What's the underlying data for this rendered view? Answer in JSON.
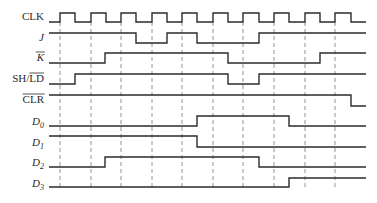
{
  "x_start": 49,
  "x_end": 366,
  "clock_edges": [
    60,
    91,
    121,
    152,
    182,
    213,
    243,
    274,
    305,
    335
  ],
  "dash_top": 22,
  "dash_bottom": 187,
  "signals": [
    {
      "name": "clk",
      "label": "CLK",
      "italic": false,
      "overline": false,
      "label_y": 16,
      "hi": 13,
      "lo": 22,
      "points": [
        [
          49,
          0
        ],
        [
          60,
          1
        ],
        [
          75,
          0
        ],
        [
          91,
          1
        ],
        [
          106,
          0
        ],
        [
          121,
          1
        ],
        [
          136,
          0
        ],
        [
          152,
          1
        ],
        [
          167,
          0
        ],
        [
          182,
          1
        ],
        [
          197,
          0
        ],
        [
          213,
          1
        ],
        [
          228,
          0
        ],
        [
          243,
          1
        ],
        [
          259,
          0
        ],
        [
          274,
          1
        ],
        [
          289,
          0
        ],
        [
          305,
          1
        ],
        [
          320,
          0
        ],
        [
          335,
          1
        ],
        [
          351,
          0
        ]
      ]
    },
    {
      "name": "j",
      "label": "J",
      "italic": true,
      "overline": false,
      "label_y": 37,
      "hi": 33,
      "lo": 43,
      "points": [
        [
          49,
          1
        ],
        [
          136,
          0
        ],
        [
          167,
          1
        ],
        [
          197,
          0
        ],
        [
          259,
          1
        ]
      ]
    },
    {
      "name": "k-bar",
      "label": "K",
      "italic": true,
      "overline": true,
      "label_y": 57,
      "hi": 53,
      "lo": 63,
      "points": [
        [
          49,
          0
        ],
        [
          105,
          1
        ],
        [
          228,
          0
        ],
        [
          320,
          1
        ]
      ]
    },
    {
      "name": "sh-ld-bar",
      "label": "SH/",
      "label2": "LD",
      "italic": false,
      "overline": "partial",
      "label_y": 78,
      "hi": 74,
      "lo": 84,
      "points": [
        [
          49,
          0
        ],
        [
          75,
          1
        ],
        [
          228,
          0
        ],
        [
          259,
          1
        ]
      ]
    },
    {
      "name": "clr-bar",
      "label": "CLR",
      "italic": false,
      "overline": true,
      "label_y": 99,
      "hi": 95,
      "lo": 106,
      "points": [
        [
          49,
          1
        ],
        [
          351,
          0
        ]
      ]
    },
    {
      "name": "d0",
      "label": "D",
      "sub": "0",
      "italic": true,
      "overline": false,
      "label_y": 121,
      "hi": 116,
      "lo": 126,
      "points": [
        [
          49,
          0
        ],
        [
          197,
          1
        ],
        [
          289,
          0
        ]
      ]
    },
    {
      "name": "d1",
      "label": "D",
      "sub": "1",
      "italic": true,
      "overline": false,
      "label_y": 142,
      "hi": 136,
      "lo": 147,
      "points": [
        [
          49,
          1
        ],
        [
          197,
          0
        ]
      ]
    },
    {
      "name": "d2",
      "label": "D",
      "sub": "2",
      "italic": true,
      "overline": false,
      "label_y": 162,
      "hi": 157,
      "lo": 167,
      "points": [
        [
          49,
          0
        ],
        [
          105,
          1
        ],
        [
          259,
          0
        ]
      ]
    },
    {
      "name": "d3",
      "label": "D",
      "sub": "3",
      "italic": true,
      "overline": false,
      "label_y": 183,
      "hi": 178,
      "lo": 187,
      "points": [
        [
          49,
          0
        ],
        [
          289,
          1
        ]
      ]
    }
  ]
}
